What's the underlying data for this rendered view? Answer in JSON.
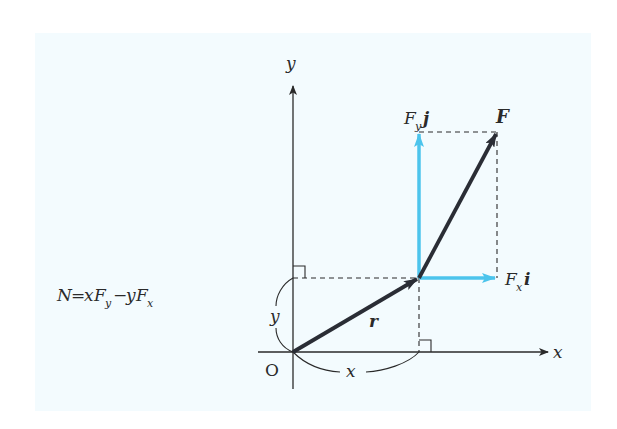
{
  "diagram": {
    "type": "vector-torque-diagram",
    "colors": {
      "background": "#ffffff",
      "panel": "#f3fbfe",
      "axis": "#2a2a2a",
      "vector": "#2a2d35",
      "component": "#4cc4ec",
      "dashed": "#2a2a2a"
    },
    "formula": {
      "text": "N = xFy − yFx",
      "N": "N",
      "eq": "=",
      "x": "x",
      "F1": "F",
      "sub_y": "y",
      "minus": "−",
      "y": "y",
      "F2": "F",
      "sub_x": "x"
    },
    "axes": {
      "x_label": "x",
      "y_label": "y",
      "origin_label": "O"
    },
    "vectors": {
      "r": {
        "label": "r",
        "from": [
          293,
          352
        ],
        "to": [
          419,
          278
        ]
      },
      "F": {
        "label": "F",
        "from": [
          419,
          278
        ],
        "to": [
          497,
          132
        ]
      }
    },
    "components": {
      "Fy": {
        "label_F": "F",
        "label_sub": "y",
        "label_unit": "j"
      },
      "Fx": {
        "label_F": "F",
        "label_sub": "x",
        "label_unit": "i"
      }
    },
    "dimensions": {
      "x_brace_label": "x",
      "y_brace_label": "y"
    }
  }
}
